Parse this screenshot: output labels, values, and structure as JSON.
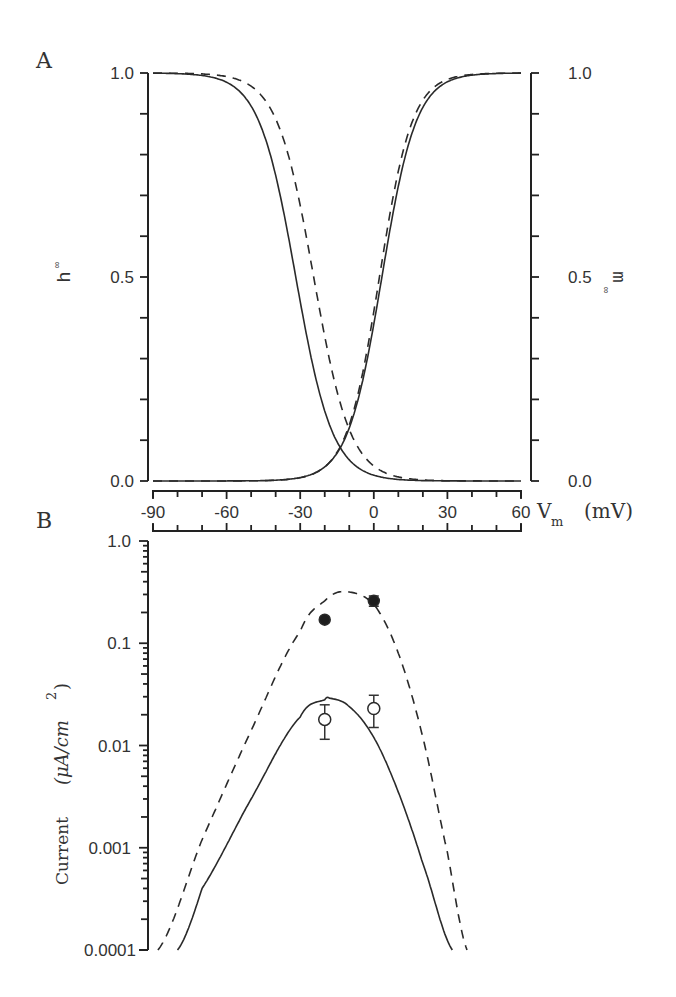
{
  "figure": {
    "panel_a_label": "A",
    "panel_b_label": "B"
  },
  "chart_data": [
    {
      "panel": "A",
      "type": "line",
      "title": "",
      "xlabel": "V_m (mV)",
      "xlabel_main": "V",
      "xlabel_sub": "m",
      "xlabel_unit": "(mV)",
      "ylabel_left": "h∞",
      "ylabel_left_main": "h",
      "ylabel_right": "m∞",
      "ylabel_right_main": "m",
      "ylabel_sub": "∞",
      "xlim": [
        -90,
        60
      ],
      "ylim": [
        0.0,
        1.0
      ],
      "xticks": [
        -90,
        -60,
        -30,
        0,
        30,
        60
      ],
      "xtick_labels": [
        "-90",
        "-60",
        "-30",
        "0",
        "30",
        "60"
      ],
      "yticks_left": [
        0.0,
        0.5,
        1.0
      ],
      "ytick_labels_left": [
        "0.0",
        "0.5",
        "1.0"
      ],
      "yticks_right": [
        0.0,
        0.5,
        1.0
      ],
      "ytick_labels_right": [
        "0.0",
        "0.5",
        "1.0"
      ],
      "grid": false,
      "legend": "none",
      "series": [
        {
          "name": "h∞ (solid)",
          "style": "solid",
          "kind": "inactivation",
          "v_half": -31.8,
          "slope": 7.5,
          "x": [
            -90,
            -60,
            -45,
            -40,
            -35,
            -30,
            -25,
            -20,
            -15,
            -10,
            0,
            30,
            60
          ],
          "values": [
            1.0,
            0.98,
            0.86,
            0.75,
            0.61,
            0.44,
            0.29,
            0.17,
            0.09,
            0.05,
            0.01,
            0.0,
            0.0
          ]
        },
        {
          "name": "h∞ (dashed)",
          "style": "dashed",
          "kind": "inactivation",
          "v_half": -24.5,
          "slope": 7.5,
          "x": [
            -90,
            -60,
            -45,
            -40,
            -35,
            -30,
            -25,
            -20,
            -15,
            -10,
            0,
            30,
            60
          ],
          "values": [
            1.0,
            0.99,
            0.94,
            0.89,
            0.81,
            0.67,
            0.52,
            0.35,
            0.21,
            0.12,
            0.03,
            0.0,
            0.0
          ]
        },
        {
          "name": "m∞ (solid)",
          "style": "solid",
          "kind": "activation",
          "v_half": 3.3,
          "slope": 7.0,
          "x": [
            -90,
            -60,
            -30,
            -20,
            -15,
            -10,
            -5,
            0,
            5,
            10,
            20,
            30,
            60
          ],
          "values": [
            0.0,
            0.0,
            0.01,
            0.04,
            0.07,
            0.13,
            0.25,
            0.38,
            0.56,
            0.73,
            0.91,
            0.98,
            1.0
          ]
        },
        {
          "name": "m∞ (dashed)",
          "style": "dashed",
          "kind": "activation",
          "v_half": 2.3,
          "slope": 6.7,
          "x": [
            -90,
            -60,
            -30,
            -20,
            -15,
            -10,
            -5,
            0,
            5,
            10,
            20,
            30,
            60
          ],
          "values": [
            0.0,
            0.0,
            0.01,
            0.03,
            0.07,
            0.13,
            0.25,
            0.41,
            0.6,
            0.76,
            0.93,
            0.98,
            1.0
          ]
        }
      ]
    },
    {
      "panel": "B",
      "type": "line",
      "title": "",
      "xlabel": "V_m (mV)",
      "ylabel": "Current (μA/cm²)",
      "ylabel_text": "Current",
      "ylabel_unit": "(μA/cm",
      "ylabel_exp": "2",
      "ylabel_close": ")",
      "yscale": "log",
      "xlim": [
        -90,
        60
      ],
      "ylim": [
        0.0001,
        1.0
      ],
      "xticks": [
        -90,
        -60,
        -30,
        0,
        30,
        60
      ],
      "yticks": [
        0.0001,
        0.001,
        0.01,
        0.1,
        1.0
      ],
      "ytick_labels": [
        "0.0001",
        "0.001",
        "0.01",
        "0.1",
        "1.0"
      ],
      "grid": false,
      "legend": "none",
      "series": [
        {
          "name": "model (dashed)",
          "style": "dashed",
          "peak_v": -12,
          "peak_i": 0.32,
          "x": [
            -88,
            -70,
            -50,
            -30,
            -20,
            -12,
            0,
            10,
            20,
            30,
            38
          ],
          "values": [
            0.0001,
            0.0012,
            0.014,
            0.13,
            0.26,
            0.32,
            0.24,
            0.08,
            0.012,
            0.0009,
            0.0001
          ]
        },
        {
          "name": "model (solid)",
          "style": "solid",
          "peak_v": -18,
          "peak_i": 0.029,
          "x": [
            -80,
            -70,
            -50,
            -30,
            -20,
            -18,
            -10,
            0,
            10,
            20,
            32
          ],
          "values": [
            0.0001,
            0.0004,
            0.003,
            0.019,
            0.028,
            0.029,
            0.024,
            0.012,
            0.0035,
            0.0007,
            0.0001
          ]
        },
        {
          "name": "data (filled circles)",
          "style": "marker-filled",
          "x": [
            -20,
            0
          ],
          "values": [
            0.17,
            0.26
          ],
          "err_low": [
            0.16,
            0.23
          ],
          "err_high": [
            0.18,
            0.29
          ]
        },
        {
          "name": "data (open circles)",
          "style": "marker-open",
          "x": [
            -20,
            0
          ],
          "values": [
            0.018,
            0.023
          ],
          "err_low": [
            0.0115,
            0.015
          ],
          "err_high": [
            0.025,
            0.031
          ]
        }
      ]
    }
  ]
}
